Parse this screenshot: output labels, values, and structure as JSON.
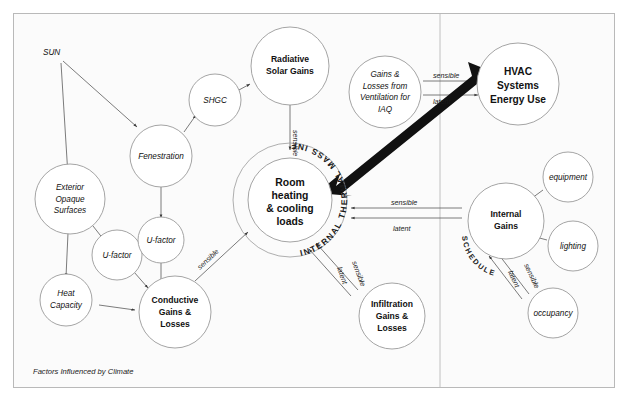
{
  "figure": {
    "caption": "Factors Influenced by Climate",
    "background": "#fbfbfb",
    "frame_color": "#b9b9b9",
    "node_stroke": "#9a9a9a",
    "edge_color": "#5a5a5a",
    "accent_color": "#111111"
  },
  "nodes": {
    "sun": "SUN",
    "shgc": "SHGC",
    "fenestration": "Fenestration",
    "radiative_solar_gains": [
      "Radiative",
      "Solar Gains"
    ],
    "exterior_opaque_surfaces": [
      "Exterior",
      "Opaque",
      "Surfaces"
    ],
    "u_factor_left": "U-factor",
    "u_factor_mid": "U-factor",
    "heat_capacity": [
      "Heat",
      "Capacity"
    ],
    "conductive_gains_losses": [
      "Conductive",
      "Gains &",
      "Losses"
    ],
    "room_loads": [
      "Room",
      "heating",
      "& cooling",
      "loads"
    ],
    "infiltration_gains_losses": [
      "Infiltration",
      "Gains &",
      "Losses"
    ],
    "ventilation_iaq": [
      "Gains &",
      "Losses from",
      "Ventilation for",
      "IAQ"
    ],
    "hvac_systems": [
      "HVAC",
      "Systems",
      "Energy Use"
    ],
    "internal_gains": [
      "Internal",
      "Gains"
    ],
    "equipment": "equipment",
    "lighting": "lighting",
    "occupancy": "occupancy"
  },
  "rings": {
    "thermal_mass": "INTERNAL THERMAL MASS INFLUENCES",
    "schedules": "SCHEDULES"
  },
  "edge_labels": {
    "solar_sensible": "sensible",
    "conductive_sensible": "sensible",
    "infiltration_sensible": "sensible",
    "infiltration_latent": "latent",
    "ventilation_sensible": "sensible",
    "ventilation_latent": "latent",
    "internal_sensible": "sensible",
    "internal_latent": "latent",
    "occupancy_sensible": "sensible",
    "occupancy_latent": "latent"
  }
}
